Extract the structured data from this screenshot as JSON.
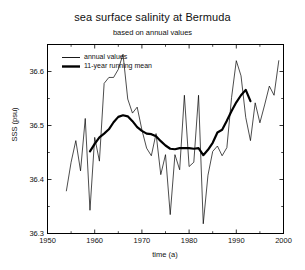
{
  "chart_data": {
    "type": "line",
    "title": "sea surface salinity at Bermuda",
    "subtitle": "based on annual values",
    "xlabel": "time (a)",
    "ylabel": "SSS (psu)",
    "xlim": [
      1950,
      2000
    ],
    "ylim": [
      36.3,
      36.65
    ],
    "xticks": [
      1950,
      1960,
      1970,
      1980,
      1990,
      2000
    ],
    "xtick_labels": [
      "1950",
      "1960",
      "1970",
      "1980",
      "1990",
      "2000"
    ],
    "yticks": [
      36.3,
      36.4,
      36.5,
      36.6
    ],
    "ytick_labels": [
      "36.3",
      "36.4",
      "36.5",
      "36.6"
    ],
    "y_minor_ticks": [
      36.35,
      36.45,
      36.55,
      36.65
    ],
    "grid": false,
    "legend_position": "upper-left-inside",
    "series": [
      {
        "name": "annual values",
        "style": "thin",
        "linewidth": 0.7,
        "color": "#000000",
        "x": [
          1954,
          1955,
          1956,
          1957,
          1958,
          1959,
          1960,
          1961,
          1962,
          1963,
          1964,
          1965,
          1966,
          1967,
          1968,
          1969,
          1970,
          1971,
          1972,
          1973,
          1974,
          1975,
          1976,
          1977,
          1978,
          1979,
          1980,
          1981,
          1982,
          1983,
          1984,
          1985,
          1986,
          1987,
          1988,
          1989,
          1990,
          1991,
          1992,
          1993,
          1994,
          1995,
          1996,
          1997,
          1998,
          1999
        ],
        "values": [
          36.379,
          36.432,
          36.472,
          36.416,
          36.513,
          36.343,
          36.478,
          36.434,
          36.578,
          36.589,
          36.589,
          36.604,
          36.632,
          36.549,
          36.523,
          36.534,
          36.492,
          36.458,
          36.444,
          36.485,
          36.409,
          36.446,
          36.335,
          36.446,
          36.418,
          36.556,
          36.424,
          36.432,
          36.556,
          36.318,
          36.408,
          36.452,
          36.462,
          36.444,
          36.459,
          36.552,
          36.62,
          36.592,
          36.515,
          36.472,
          36.542,
          36.505,
          36.538,
          36.573,
          36.556,
          36.62
        ]
      },
      {
        "name": "11-year running mean",
        "style": "thick",
        "linewidth": 2.2,
        "color": "#000000",
        "x": [
          1959,
          1960,
          1961,
          1962,
          1963,
          1964,
          1965,
          1966,
          1967,
          1968,
          1969,
          1970,
          1971,
          1972,
          1973,
          1974,
          1975,
          1976,
          1977,
          1978,
          1979,
          1980,
          1981,
          1982,
          1983,
          1984,
          1985,
          1986,
          1987,
          1988,
          1989,
          1990,
          1991,
          1992,
          1993
        ],
        "values": [
          36.452,
          36.466,
          36.478,
          36.485,
          36.493,
          36.506,
          36.516,
          36.519,
          36.517,
          36.508,
          36.497,
          36.49,
          36.485,
          36.484,
          36.48,
          36.471,
          36.463,
          36.457,
          36.456,
          36.458,
          36.458,
          36.458,
          36.457,
          36.458,
          36.445,
          36.455,
          36.468,
          36.487,
          36.492,
          36.509,
          36.527,
          36.543,
          36.556,
          36.566,
          36.545
        ]
      }
    ]
  },
  "legend": {
    "items": [
      {
        "label": "annual values",
        "style": "thin"
      },
      {
        "label": "11-year running mean",
        "style": "thick"
      }
    ]
  }
}
